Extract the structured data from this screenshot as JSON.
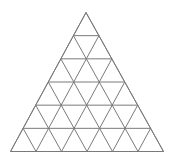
{
  "diagram": {
    "type": "triangular-grid",
    "subdivisions": 6,
    "apex": [
      86,
      12.5
    ],
    "base_left": [
      10.5,
      151.5
    ],
    "base_right": [
      163.5,
      151.5
    ],
    "line_color": "#7a7a7a",
    "background": "#ffffff"
  }
}
